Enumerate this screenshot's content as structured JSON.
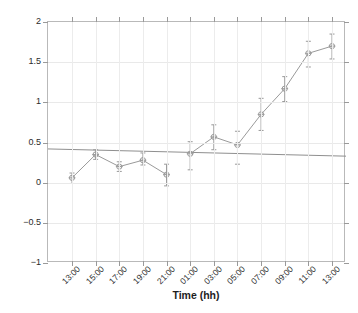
{
  "chart_data": {
    "type": "line",
    "title": "",
    "xlabel": "Time (hh)",
    "ylabel": "Displacement (mm)",
    "ylim": [
      -1,
      2
    ],
    "yticks": [
      2,
      1.5,
      1,
      0.5,
      0,
      -0.5,
      -1
    ],
    "ytick_labels": [
      "2",
      "1.5",
      "1",
      "0.5",
      "0",
      "−0.5",
      "−1"
    ],
    "categories": [
      "13:00",
      "15:00",
      "17:00",
      "19:00",
      "21:00",
      "01:00",
      "03:00",
      "05:00",
      "07:00",
      "09:00",
      "11:00",
      "13:00"
    ],
    "grid": true,
    "legend": null,
    "series": [
      {
        "name": "Displacement",
        "color": "#9a9a9a",
        "marker": "circle-with-cross",
        "values": [
          0.06,
          0.35,
          0.2,
          0.28,
          0.1,
          0.36,
          0.57,
          0.47,
          0.85,
          1.17,
          1.61,
          1.7
        ],
        "yerr_lower": [
          0.07,
          0.06,
          0.06,
          0.06,
          0.14,
          0.2,
          0.16,
          0.24,
          0.2,
          0.16,
          0.17,
          0.16
        ],
        "yerr_upper": [
          0.06,
          0.06,
          0.06,
          0.09,
          0.13,
          0.15,
          0.15,
          0.17,
          0.2,
          0.15,
          0.15,
          0.15
        ]
      },
      {
        "name": "Trend line",
        "color": "#8f8f8f",
        "type": "trend",
        "x_endpoints": [
          "left-edge",
          "right-edge"
        ],
        "y_endpoints": [
          0.42,
          0.33
        ]
      }
    ],
    "gap_between_points": "break between 21:00 and 01:00 (no connecting segment)",
    "axis_box": true
  },
  "axis": {
    "x_title": "Time (hh)",
    "y_title": "Displacement (mm)"
  },
  "caption": ""
}
